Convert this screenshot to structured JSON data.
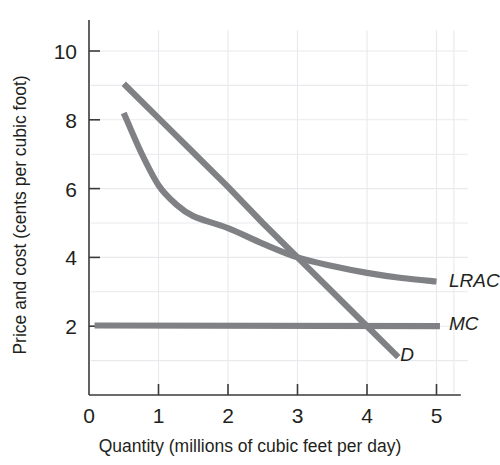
{
  "chart_data": {
    "type": "line",
    "title": "",
    "subtitle": "",
    "xlabel": "Quantity (millions of cubic feet per day)",
    "ylabel": "Price and cost (cents per cubic foot)",
    "xlim": [
      0,
      5.25
    ],
    "ylim": [
      0,
      11
    ],
    "xticks": [
      0,
      1,
      2,
      3,
      4,
      5
    ],
    "xtick_labels": [
      "0",
      "1",
      "2",
      "3",
      "4",
      "5"
    ],
    "yticks": [
      2,
      4,
      6,
      8,
      10
    ],
    "ytick_labels": [
      "2",
      "4",
      "6",
      "8",
      "10"
    ],
    "grid": true,
    "grid_color": "#e9e9ed",
    "legend_position": "right-inline-labels",
    "series_color": "#7f8184",
    "series": [
      {
        "name": "D",
        "label": "D",
        "kind": "line",
        "description": "Demand curve, downward sloping straight line",
        "x": [
          0.5,
          1.0,
          1.5,
          2.0,
          2.5,
          3.0,
          3.5,
          4.0,
          4.45
        ],
        "values": [
          9.05,
          8.05,
          7.05,
          6.05,
          5.0,
          4.0,
          3.0,
          2.0,
          1.1
        ],
        "label_x": 4.48,
        "label_y": 1.2
      },
      {
        "name": "LRAC",
        "label": "LRAC",
        "kind": "curve",
        "description": "Long-run average cost curve, convex and decreasing",
        "x": [
          0.5,
          0.75,
          1.0,
          1.25,
          1.5,
          2.0,
          2.5,
          3.0,
          3.5,
          4.0,
          4.5,
          5.0
        ],
        "values": [
          8.2,
          7.05,
          6.1,
          5.55,
          5.2,
          4.85,
          4.4,
          4.0,
          3.75,
          3.55,
          3.4,
          3.3
        ],
        "label_x": 5.18,
        "label_y": 3.35
      },
      {
        "name": "MC",
        "label": "MC",
        "kind": "line",
        "description": "Marginal cost, constant horizontal line at 2 cents",
        "x": [
          0.08,
          5.05
        ],
        "values": [
          2.02,
          2.0
        ],
        "label_x": 5.18,
        "label_y": 2.08
      }
    ],
    "annotations": [
      {
        "name": "d-lrac-intersection",
        "x": 3.0,
        "y": 4.0,
        "text": ""
      },
      {
        "name": "d-mc-intersection",
        "x": 4.0,
        "y": 2.0,
        "text": ""
      }
    ]
  }
}
